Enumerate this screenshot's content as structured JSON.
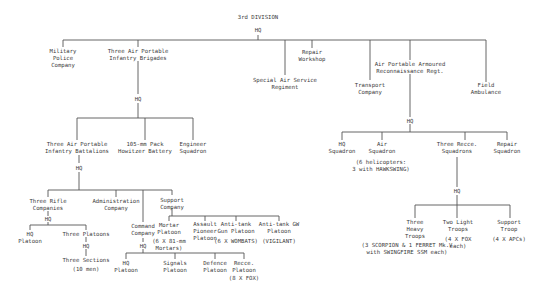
{
  "title": "3rd DIVISION",
  "nodes": {
    "div_hq": "HQ",
    "mp": "Military\nPolice\nCompany",
    "brigades": "Three Air Portable\nInfantry Brigades",
    "repair_ws": "Repair\nWorkshop",
    "sas": "Special Air Service\nRegiment",
    "transport": "Transport\nCompany",
    "recce_regt": "Air Portable Armoured\nReconnaissance Regt.",
    "field_amb": "Field\nAmbulance",
    "bde_hq": "HQ",
    "battalions": "Three Air Portable\nInfantry Battalions",
    "howitzer": "105-mm Pack\nHowitzer Battery",
    "engineer": "Engineer\nSquadron",
    "bn_hq": "HQ",
    "rifle_cos": "Three Rifle\nCompanies",
    "admin_co": "Administration\nCompany",
    "support_co": "Support\nCompany",
    "rifle_hq": "HQ",
    "hq_platoon": "HQ\nPlatoon",
    "three_platoons": "Three Platoons",
    "plt_hq": "HQ",
    "sections": "Three Sections",
    "sections_note": "(10 men)",
    "command_co": "Command\nCompany",
    "cmd_hq": "HQ",
    "cmd_hq_platoon": "HQ\nPlatoon",
    "signals": "Signals\nPlatoon",
    "defence": "Defence\nPlatoon",
    "recce_plt": "Recce.\nPlatoon",
    "recce_plt_note": "(8 X FOX)",
    "mortar": "Mortar\nPlatoon",
    "mortar_note": "(6 X 81-mm\nMortars)",
    "pioneer": "Assault\nPioneer\nPlatoon",
    "at_gun": "Anti-tank\nGun Platoon",
    "at_gun_note": "(6 X WOMBATS)",
    "at_gw": "Anti-tank GW\nPlatoon",
    "at_gw_note": "(VIGILANT)",
    "regt_hq": "HQ",
    "hq_sqn": "HQ\nSquadron",
    "air_sqn": "Air\nSquadron",
    "air_sqn_note": "(6 helicopters:\n3 with HAWKSWING)",
    "recce_sqns": "Three Recce.\nSquadrons",
    "repair_sqn": "Repair\nSquadron",
    "sqn_hq": "HQ",
    "heavy_troops": "Three\nHeavy\nTroops",
    "heavy_note": "(3 SCORPION & 1 FERRET Mk.V\nwith SWINGFIRE SSM each)",
    "light_troops": "Two Light\nTroops",
    "light_note": "(4 X FOX\neach)",
    "support_troop": "Support\nTroop",
    "support_troop_note": "(4 X APCs)"
  }
}
